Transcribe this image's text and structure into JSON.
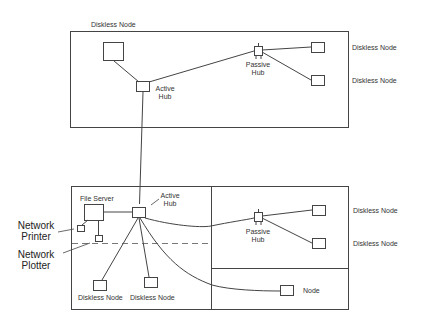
{
  "diagram": {
    "type": "network-topology",
    "top_segment": {
      "title_label": "Diskless Node",
      "active_hub": {
        "line1": "Active",
        "line2": "Hub"
      },
      "passive_hub": {
        "line1": "Passive",
        "line2": "Hub"
      },
      "right_nodes": [
        "Diskless Node",
        "Diskless Node"
      ]
    },
    "bottom_segment": {
      "file_server": "File Server",
      "active_hub": {
        "line1": "Active",
        "line2": "Hub"
      },
      "network_printer": {
        "line1": "Network",
        "line2": "Printer"
      },
      "network_plotter": {
        "line1": "Network",
        "line2": "Plotter"
      },
      "bottom_nodes": [
        "Diskless Node",
        "Diskless Node"
      ],
      "passive_hub": {
        "line1": "Passive",
        "line2": "Hub"
      },
      "right_nodes": [
        "Diskless Node",
        "Diskless Node"
      ],
      "far_node": "Node"
    },
    "colors": {
      "line": "#444444",
      "background": "#ffffff"
    }
  }
}
